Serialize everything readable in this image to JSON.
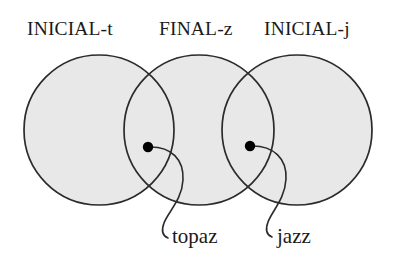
{
  "figure": {
    "type": "venn-diagram",
    "background_color": "#ffffff",
    "circle_fill_color": "#e8e8e8",
    "circle_stroke_color": "#2b2b2b",
    "dot_color": "#000000",
    "leader_line_color": "#2b2b2b",
    "text_color": "#1a1a1a"
  },
  "headers": {
    "left": "INICIAL-t",
    "middle": "FINAL-z",
    "right": "INICIAL-j"
  },
  "sets": [
    {
      "id": "set-left",
      "label": "INICIAL-t",
      "cx": 99,
      "cy": 130,
      "r": 75
    },
    {
      "id": "set-middle",
      "label": "FINAL-z",
      "cx": 199,
      "cy": 130,
      "r": 75
    },
    {
      "id": "set-right",
      "label": "INICIAL-j",
      "cx": 297,
      "cy": 130,
      "r": 75
    }
  ],
  "points": [
    {
      "id": "point-topaz",
      "label": "topaz",
      "x": 148,
      "y": 147,
      "region": "INICIAL-t ∩ FINAL-z"
    },
    {
      "id": "point-jazz",
      "label": "jazz",
      "x": 250,
      "y": 146,
      "region": "FINAL-z ∩ INICIAL-j"
    }
  ],
  "annotations": {
    "topaz": "topaz",
    "jazz": "jazz"
  }
}
